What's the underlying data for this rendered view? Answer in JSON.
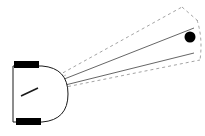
{
  "figure": {
    "canvas": {
      "width": 205,
      "height": 136,
      "background": "#ffffff"
    },
    "colors": {
      "outline": "#1a1a1a",
      "wheel_fill": "#000000",
      "target_fill": "#000000",
      "ray_solid": "#555555",
      "ray_dashed": "#999999",
      "body_fill": "#ffffff"
    },
    "robot": {
      "label": "differential-drive robot",
      "body": {
        "x": 12,
        "y": 66,
        "width": 56,
        "height": 56,
        "rounded_side": "right",
        "corner_radius": 26,
        "fill": "#ffffff",
        "stroke": "#1a1a1a",
        "stroke_width": 1
      },
      "wheels": [
        {
          "name": "top-wheel",
          "x": 14,
          "y": 61,
          "width": 25,
          "height": 7,
          "fill": "#000000"
        },
        {
          "name": "bottom-wheel",
          "x": 16,
          "y": 118,
          "width": 25,
          "height": 7,
          "fill": "#000000"
        }
      ],
      "sensor_origin": {
        "x": 21,
        "y": 96
      }
    },
    "target": {
      "label": "target point",
      "cx": 190,
      "cy": 37,
      "r": 5.5,
      "fill": "#000000"
    },
    "rays": {
      "solid": [
        {
          "name": "ray-upper-solid",
          "x1": 21,
          "y1": 96,
          "x2": 194,
          "y2": 28,
          "stroke": "#555555",
          "stroke_width": 0.9
        },
        {
          "name": "ray-lower-solid",
          "x1": 21,
          "y1": 96,
          "x2": 194,
          "y2": 53,
          "stroke": "#555555",
          "stroke_width": 0.9
        }
      ],
      "dashed": [
        {
          "name": "cone-upper-dashed",
          "x1": 21,
          "y1": 96,
          "x2": 182,
          "y2": 7,
          "stroke": "#999999",
          "stroke_width": 0.9,
          "dash": "3 3"
        },
        {
          "name": "cone-lower-dashed",
          "x1": 21,
          "y1": 96,
          "x2": 200,
          "y2": 60,
          "stroke": "#999999",
          "stroke_width": 0.9,
          "dash": "3 3"
        }
      ],
      "dashed_caps": [
        {
          "name": "cone-top-edge-dashed",
          "x1": 182,
          "y1": 7,
          "x2": 197,
          "y2": 20,
          "stroke": "#999999",
          "stroke_width": 0.9,
          "dash": "3 3"
        }
      ],
      "dashed_arc": {
        "name": "cone-far-arc-dashed",
        "path": "M 197 20 Q 203 38 200 60",
        "stroke": "#999999",
        "stroke_width": 0.9,
        "dash": "3 3"
      },
      "body_arc": {
        "name": "robot-front-arc",
        "path": "M 42 66 Q 68 70 68 94 Q 68 118 42 122",
        "stroke": "#1a1a1a",
        "stroke_width": 1
      }
    },
    "fan": {
      "label": "beam fan near origin",
      "lines": [
        {
          "name": "fan-line-1",
          "x1": 21,
          "y1": 96,
          "x2": 66,
          "y2": 75,
          "stroke": "#aaaaaa",
          "stroke_width": 0.7
        },
        {
          "name": "fan-line-2",
          "x1": 21,
          "y1": 96,
          "x2": 66,
          "y2": 80,
          "stroke": "#aaaaaa",
          "stroke_width": 0.7
        },
        {
          "name": "fan-line-3",
          "x1": 21,
          "y1": 96,
          "x2": 66,
          "y2": 85,
          "stroke": "#aaaaaa",
          "stroke_width": 0.7
        },
        {
          "name": "fan-line-4",
          "x1": 21,
          "y1": 96,
          "x2": 66,
          "y2": 92,
          "stroke": "#aaaaaa",
          "stroke_width": 0.7
        },
        {
          "name": "fan-line-5",
          "x1": 21,
          "y1": 96,
          "x2": 66,
          "y2": 100,
          "stroke": "#aaaaaa",
          "stroke_width": 0.7
        }
      ]
    }
  }
}
